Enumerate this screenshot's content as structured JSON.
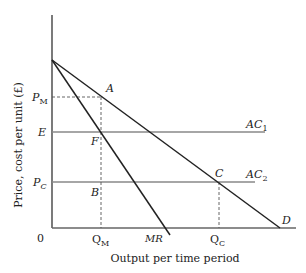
{
  "diagram": {
    "type": "economics-monopoly-vs-competition",
    "y_axis_label": "Price, cost per unit (£)",
    "x_axis_label": "Output per time period",
    "origin_label": "0",
    "y_tick_labels": {
      "pm": {
        "main": "P",
        "sub": "M"
      },
      "e": "E",
      "pc": {
        "main": "P",
        "sub": "C"
      }
    },
    "x_tick_labels": {
      "qm": {
        "main": "Q",
        "sub": "M"
      },
      "mr": "MR",
      "qc": {
        "main": "Q",
        "sub": "C"
      }
    },
    "curve_labels": {
      "ac1": {
        "main": "AC",
        "sub": "1"
      },
      "ac2": {
        "main": "AC",
        "sub": "2"
      },
      "demand": "D"
    },
    "point_labels": {
      "a": "A",
      "f": "F",
      "b": "B",
      "c": "C"
    },
    "colors": {
      "axis": "#333333",
      "curve": "#222222",
      "ac_line": "#777777",
      "dashed": "#555555"
    }
  }
}
